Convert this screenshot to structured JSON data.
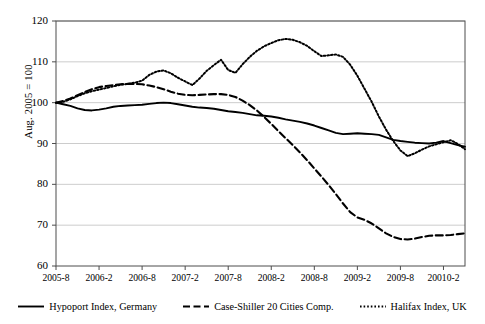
{
  "chart_data": {
    "type": "line",
    "title": "",
    "subtitle": "",
    "xlabel": "",
    "ylabel": "Aug. 2005 = 100",
    "ylim": [
      60,
      120
    ],
    "yticks": [
      60,
      70,
      80,
      90,
      100,
      110,
      120
    ],
    "grid": "horizontal",
    "legend_position": "bottom",
    "x_tick_labels": [
      "2005-8",
      "2006-2",
      "2006-8",
      "2007-2",
      "2007-8",
      "2008-2",
      "2008-8",
      "2009-2",
      "2009-8",
      "20010-2"
    ],
    "x_tick_indices": [
      0,
      6,
      12,
      18,
      24,
      30,
      36,
      42,
      48,
      54
    ],
    "x": [
      "2005-8",
      "2005-9",
      "2005-10",
      "2005-11",
      "2005-12",
      "2006-1",
      "2006-2",
      "2006-3",
      "2006-4",
      "2006-5",
      "2006-6",
      "2006-7",
      "2006-8",
      "2006-9",
      "2006-10",
      "2006-11",
      "2006-12",
      "2007-1",
      "2007-2",
      "2007-3",
      "2007-4",
      "2007-5",
      "2007-6",
      "2007-7",
      "2007-8",
      "2007-9",
      "2007-10",
      "2007-11",
      "2007-12",
      "2008-1",
      "2008-2",
      "2008-3",
      "2008-4",
      "2008-5",
      "2008-6",
      "2008-7",
      "2008-8",
      "2008-9",
      "2008-10",
      "2008-11",
      "2008-12",
      "2009-1",
      "2009-2",
      "2009-3",
      "2009-4",
      "2009-5",
      "2009-6",
      "2009-7",
      "2009-8",
      "2009-9",
      "2009-10",
      "2009-11",
      "2009-12",
      "2010-1",
      "2010-2",
      "2010-3",
      "2010-4",
      "2010-5"
    ],
    "series": [
      {
        "name": "Hypoport Index, Germany",
        "style": "solid",
        "color": "#000000",
        "values": [
          100.0,
          99.6,
          99.2,
          98.6,
          98.2,
          98.1,
          98.3,
          98.6,
          99.0,
          99.2,
          99.3,
          99.4,
          99.5,
          99.7,
          99.9,
          100.0,
          99.9,
          99.6,
          99.3,
          99.0,
          98.8,
          98.7,
          98.5,
          98.2,
          97.9,
          97.7,
          97.5,
          97.2,
          96.9,
          96.8,
          96.6,
          96.3,
          95.9,
          95.6,
          95.3,
          94.9,
          94.4,
          93.8,
          93.2,
          92.6,
          92.3,
          92.4,
          92.5,
          92.4,
          92.3,
          92.1,
          91.5,
          90.9,
          90.6,
          90.4,
          90.2,
          90.1,
          90.0,
          90.2,
          90.6,
          90.1,
          89.6,
          89.2
        ]
      },
      {
        "name": "Case-Shiller 20 Cities Comp.",
        "style": "dashed",
        "color": "#000000",
        "values": [
          100.0,
          100.4,
          101.0,
          101.8,
          102.6,
          103.3,
          103.8,
          104.1,
          104.3,
          104.5,
          104.6,
          104.6,
          104.5,
          104.2,
          103.8,
          103.3,
          102.7,
          102.2,
          101.9,
          101.8,
          101.9,
          102.0,
          102.1,
          102.1,
          101.9,
          101.4,
          100.5,
          99.4,
          98.1,
          96.5,
          94.8,
          93.0,
          91.3,
          89.6,
          87.8,
          85.9,
          83.9,
          81.9,
          79.8,
          77.6,
          75.3,
          73.2,
          71.9,
          71.3,
          70.4,
          69.2,
          68.0,
          67.1,
          66.6,
          66.5,
          66.7,
          67.1,
          67.4,
          67.5,
          67.5,
          67.6,
          67.8,
          68.0
        ]
      },
      {
        "name": "Halifax Index, UK",
        "style": "dotted",
        "color": "#000000",
        "values": [
          100.0,
          100.2,
          100.8,
          101.6,
          102.3,
          102.8,
          103.2,
          103.6,
          104.0,
          104.4,
          104.6,
          104.9,
          105.4,
          106.8,
          107.6,
          107.9,
          107.2,
          106.1,
          105.2,
          104.3,
          105.9,
          107.8,
          109.2,
          110.5,
          108.0,
          107.3,
          109.4,
          111.2,
          112.7,
          113.8,
          114.6,
          115.3,
          115.6,
          115.4,
          114.8,
          113.9,
          112.6,
          111.4,
          111.6,
          111.8,
          111.2,
          109.3,
          106.6,
          103.4,
          100.2,
          96.6,
          93.4,
          90.6,
          88.3,
          86.9,
          87.6,
          88.5,
          89.3,
          89.8,
          90.3,
          90.8,
          89.9,
          88.6
        ]
      }
    ]
  },
  "legend": {
    "items": [
      {
        "label": "Hypoport Index, Germany",
        "style": "solid"
      },
      {
        "label": "Case-Shiller 20 Cities Comp.",
        "style": "dashed"
      },
      {
        "label": "Halifax Index, UK",
        "style": "dotted"
      }
    ]
  }
}
